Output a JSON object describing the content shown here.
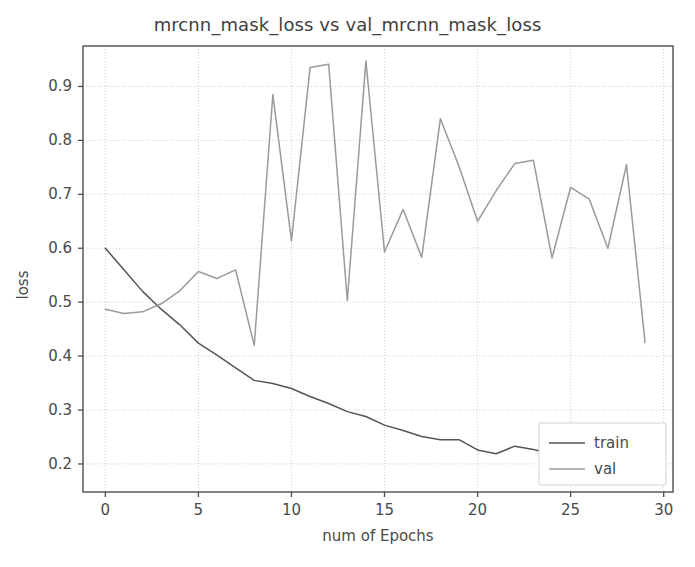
{
  "chart_data": {
    "type": "line",
    "title": "mrcnn_mask_loss vs val_mrcnn_mask_loss",
    "xlabel": "num of Epochs",
    "ylabel": "loss",
    "xlim": [
      -1.2,
      30.5
    ],
    "ylim": [
      0.148,
      0.975
    ],
    "xticks": [
      0,
      5,
      10,
      15,
      20,
      25,
      30
    ],
    "xticklabels": [
      "0",
      "5",
      "10",
      "15",
      "20",
      "25",
      "30"
    ],
    "yticks": [
      0.2,
      0.3,
      0.4,
      0.5,
      0.6,
      0.7,
      0.8,
      0.9
    ],
    "yticklabels": [
      "0.2",
      "0.3",
      "0.4",
      "0.5",
      "0.6",
      "0.7",
      "0.8",
      "0.9"
    ],
    "grid": true,
    "grid_style": "dotted",
    "legend_position": "lower right",
    "x": [
      0,
      1,
      2,
      3,
      4,
      5,
      6,
      7,
      8,
      9,
      10,
      11,
      12,
      13,
      14,
      15,
      16,
      17,
      18,
      19,
      20,
      21,
      22,
      23,
      24,
      25,
      26,
      27,
      28,
      29
    ],
    "series": [
      {
        "name": "train",
        "color": "#555555",
        "values": [
          0.6,
          0.56,
          0.52,
          0.487,
          0.458,
          0.424,
          0.402,
          0.378,
          0.355,
          0.349,
          0.34,
          0.325,
          0.312,
          0.297,
          0.288,
          0.272,
          0.262,
          0.251,
          0.245,
          0.245,
          0.226,
          0.219,
          0.233,
          0.227,
          0.219,
          0.206,
          0.196,
          0.192,
          0.196,
          0.193
        ]
      },
      {
        "name": "val",
        "color": "#9a9a9a",
        "values": [
          0.487,
          0.479,
          0.482,
          0.497,
          0.521,
          0.557,
          0.544,
          0.56,
          0.42,
          0.885,
          0.614,
          0.935,
          0.941,
          0.503,
          0.947,
          0.593,
          0.672,
          0.583,
          0.84,
          0.752,
          0.65,
          0.707,
          0.757,
          0.763,
          0.582,
          0.713,
          0.691,
          0.6,
          0.755,
          0.767
        ]
      }
    ],
    "legend": [
      {
        "label": "train",
        "color": "#555555"
      },
      {
        "label": "val",
        "color": "#9a9a9a"
      }
    ]
  },
  "chart_series_override": {
    "val": [
      0.487,
      0.479,
      0.482,
      0.497,
      0.521,
      0.557,
      0.544,
      0.56,
      0.42,
      0.885,
      0.614,
      0.935,
      0.941,
      0.503,
      0.947,
      0.593,
      0.672,
      0.583,
      0.84,
      0.752,
      0.65,
      0.707,
      0.757,
      0.763,
      0.582,
      0.713,
      0.691,
      0.6,
      0.755,
      0.425
    ]
  },
  "colors": {
    "train_line": "#555555",
    "val_line": "#9a9a9a",
    "axis": "#4d4d4d",
    "grid": "#cccccc",
    "background": "#ffffff"
  }
}
